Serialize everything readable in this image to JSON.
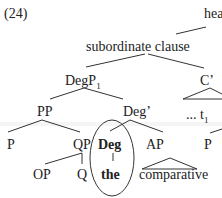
{
  "example_number": "(24)",
  "tree": {
    "root_partial": "hea",
    "subordinate_clause": "subordinate clause",
    "degp": {
      "label": "DegP",
      "subscript": "1"
    },
    "cbar": "C’",
    "pp": "PP",
    "degbar": "Deg’",
    "trace": {
      "label": "... t",
      "subscript": "1"
    },
    "p_left": "P",
    "qp": "QP",
    "deg": "Deg",
    "ap": "AP",
    "p_right": "P",
    "op": "OP",
    "q": "Q",
    "the": "the",
    "comparative": "comparative"
  },
  "colors": {
    "ink": "#222222",
    "background": "#ffffff"
  }
}
